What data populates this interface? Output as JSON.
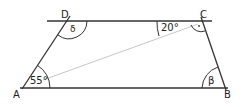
{
  "diagram": {
    "type": "trapezoid",
    "vertices": {
      "A": {
        "label": "A",
        "x": 22,
        "y": 88
      },
      "B": {
        "label": "B",
        "x": 225,
        "y": 88
      },
      "C": {
        "label": "C",
        "x": 202,
        "y": 21
      },
      "D": {
        "label": "D",
        "x": 68,
        "y": 20
      }
    },
    "angles": {
      "at_A": {
        "label": "55°"
      },
      "at_D": {
        "label": "δ"
      },
      "at_C_diag": {
        "label": "20°"
      },
      "at_C_right": {
        "label": "·"
      },
      "at_B": {
        "label": "β"
      }
    },
    "colors": {
      "line": "#333333",
      "diagonal": "#c8c8c8",
      "background": "#ffffff"
    }
  }
}
